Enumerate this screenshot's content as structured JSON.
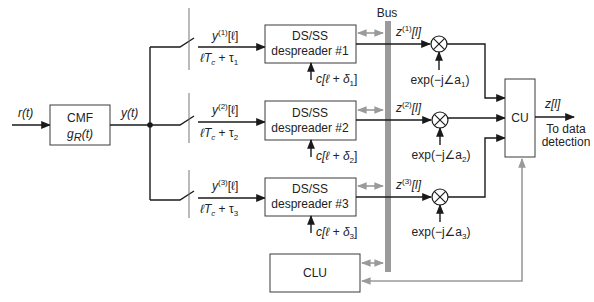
{
  "diagram": {
    "input_signal": "r(t)",
    "cmf": {
      "title": "CMF",
      "subtitle": "g_R(t)",
      "sub_main": "g",
      "sub_sub": "R",
      "sub_tail": "(t)"
    },
    "junction_signal": "y(t)",
    "bus_label": "Bus",
    "branches": [
      {
        "sample_label_main": "y",
        "sample_label_sup": "(1)",
        "sample_label_tail": "[ℓ]",
        "timing_label_main": "ℓT",
        "timing_label_sub": "c",
        "timing_label_mid": " + τ",
        "timing_label_idx": "1",
        "despreader_line1": "DS/SS",
        "despreader_line2": "despreader #1",
        "code_label_main": "c[ℓ + δ",
        "code_label_idx": "1",
        "code_label_tail": "]",
        "output_label_main": "z",
        "output_label_sup": "(1)",
        "output_label_tail": "[l]",
        "phase_label_main": "exp(−j∠a",
        "phase_label_idx": "1",
        "phase_label_tail": ")"
      },
      {
        "sample_label_main": "y",
        "sample_label_sup": "(2)",
        "sample_label_tail": "[ℓ]",
        "timing_label_main": "ℓT",
        "timing_label_sub": "c",
        "timing_label_mid": " + τ",
        "timing_label_idx": "2",
        "despreader_line1": "DS/SS",
        "despreader_line2": "despreader #2",
        "code_label_main": "c[ℓ + δ",
        "code_label_idx": "2",
        "code_label_tail": "]",
        "output_label_main": "z",
        "output_label_sup": "(2)",
        "output_label_tail": "[l]",
        "phase_label_main": "exp(−j∠a",
        "phase_label_idx": "2",
        "phase_label_tail": ")"
      },
      {
        "sample_label_main": "y",
        "sample_label_sup": "(3)",
        "sample_label_tail": "[ℓ]",
        "timing_label_main": "ℓT",
        "timing_label_sub": "c",
        "timing_label_mid": " + τ",
        "timing_label_idx": "3",
        "despreader_line1": "DS/SS",
        "despreader_line2": "despreader #3",
        "code_label_main": "c[ℓ + δ",
        "code_label_idx": "3",
        "code_label_tail": "]",
        "output_label_main": "z",
        "output_label_sup": "(3)",
        "output_label_tail": "[l]",
        "phase_label_main": "exp(−j∠a",
        "phase_label_idx": "3",
        "phase_label_tail": ")"
      }
    ],
    "combiner": {
      "title": "CU",
      "output_label": "z[l]",
      "destination_line1": "To data",
      "destination_line2": "detection"
    },
    "control": {
      "title": "CLU"
    },
    "colors": {
      "wire": "#1a1a1a",
      "bus": "#9a9a9a",
      "control_wire": "#9a9a9a",
      "box_border": "#3a3a3a"
    }
  }
}
